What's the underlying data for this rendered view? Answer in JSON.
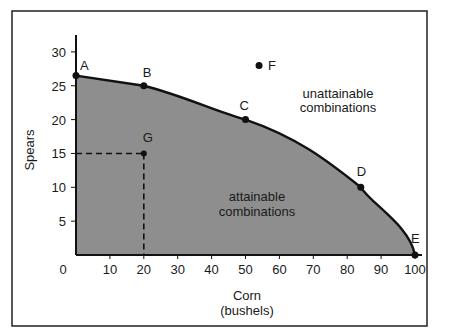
{
  "chart_data": {
    "type": "line",
    "title": "",
    "xlabel": "Corn",
    "xlabel_sub": "(bushels)",
    "ylabel": "Spears",
    "xlim": [
      0,
      105
    ],
    "ylim": [
      0,
      32
    ],
    "x_ticks": [
      0,
      10,
      20,
      30,
      40,
      50,
      60,
      70,
      80,
      90,
      100
    ],
    "y_ticks": [
      5,
      10,
      15,
      20,
      25,
      30
    ],
    "grid": false,
    "series": [
      {
        "name": "Production possibilities frontier",
        "points": [
          {
            "label": "A",
            "x": 0,
            "y": 26.5
          },
          {
            "label": "B",
            "x": 20,
            "y": 25
          },
          {
            "label": "C",
            "x": 50,
            "y": 20
          },
          {
            "label": "D",
            "x": 84,
            "y": 10
          },
          {
            "label": "E",
            "x": 100,
            "y": 0
          }
        ]
      }
    ],
    "extra_points": [
      {
        "label": "F",
        "x": 54,
        "y": 28
      },
      {
        "label": "G",
        "x": 20,
        "y": 15
      }
    ],
    "annotations": [
      {
        "text": [
          "unattainable",
          "combinations"
        ],
        "x": 70,
        "y": 22
      },
      {
        "text": [
          "attainable",
          "combinations"
        ],
        "x": 40,
        "y": 8
      }
    ],
    "fill_color": "#8e8e8e"
  },
  "labels": {
    "x_axis_title": "Corn",
    "x_axis_subtitle": "(bushels)",
    "y_axis_title": "Spears",
    "unattainable_1": "unattainable",
    "unattainable_2": "combinations",
    "attainable_1": "attainable",
    "attainable_2": "combinations",
    "origin": "0",
    "points": {
      "A": "A",
      "B": "B",
      "C": "C",
      "D": "D",
      "E": "E",
      "F": "F",
      "G": "G"
    }
  }
}
